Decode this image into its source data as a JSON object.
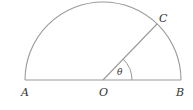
{
  "diagram": {
    "type": "semicircle-geometry",
    "labels": {
      "A": "A",
      "O": "O",
      "B": "B",
      "C": "C",
      "theta": "θ"
    },
    "points": {
      "A": [
        25,
        80
      ],
      "O": [
        103,
        80
      ],
      "B": [
        181,
        80
      ],
      "C": [
        157,
        24
      ]
    },
    "radius": 78,
    "angle_arc_radius": 29,
    "stroke_color": "#9a9a9a",
    "label_color": "#333333"
  }
}
